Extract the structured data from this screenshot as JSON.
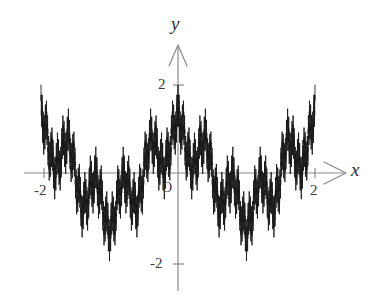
{
  "figure": {
    "background_color": "#ffffff",
    "width": 379,
    "height": 301
  },
  "axes": {
    "color": "#8a8a8a",
    "origin_label": "O",
    "x_axis": {
      "label": "x",
      "tick_labels": [
        "-2",
        "2"
      ],
      "tick_values": [
        -2,
        2
      ],
      "range": [
        -2.25,
        2.45
      ]
    },
    "y_axis": {
      "label": "y",
      "tick_labels": [
        "2",
        "-2"
      ],
      "tick_values": [
        2,
        -2
      ],
      "range": [
        -2.6,
        2.75
      ]
    }
  },
  "chart_data": {
    "type": "line",
    "title": "",
    "xlabel": "x",
    "ylabel": "y",
    "xlim": [
      -2.25,
      2.45
    ],
    "ylim": [
      -2.6,
      2.75
    ],
    "grid": false,
    "legend": false,
    "line_color": "#1a1a1a",
    "line_width": 0.9,
    "formula": "f(x) = sum_{n=0}^{N} a^n * cos(b^n * pi * x)",
    "parameters": {
      "a": 0.62,
      "b": 5,
      "N": 7,
      "amplitude_scale": 2.0
    },
    "tick_marks": {
      "x": [
        -2,
        2
      ],
      "y": [
        -2,
        2
      ]
    },
    "series": [
      {
        "name": "weierstrass",
        "x_domain": [
          -2,
          2
        ],
        "sample_count": 6000,
        "approx_max": 2.0,
        "approx_min": -1.75
      }
    ]
  }
}
